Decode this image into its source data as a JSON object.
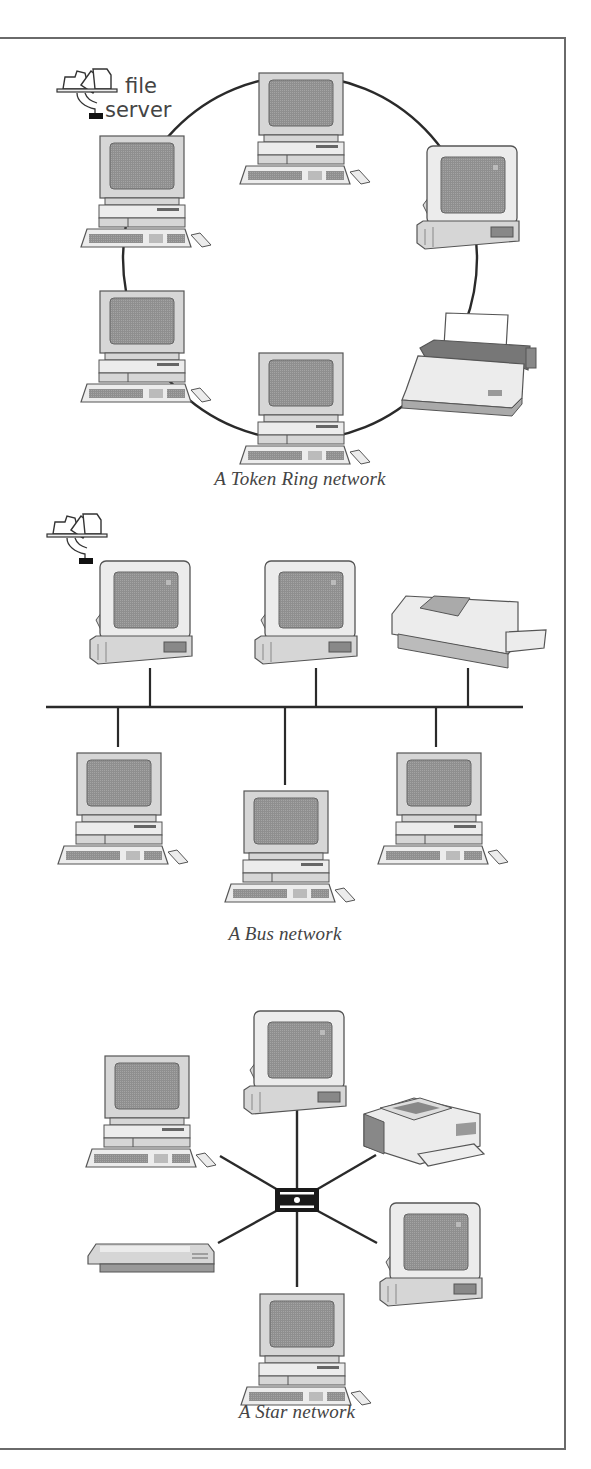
{
  "figure": {
    "colors": {
      "wire": "#2a2a2a",
      "frame": "#6a6a6a",
      "caption": "#444444",
      "screen": "#8f8f8f",
      "case": "#d6d6d6",
      "case_light": "#ececec",
      "outline": "#555555"
    },
    "token_ring": {
      "caption": "A Token Ring network",
      "caption_pos": [
        300,
        480
      ],
      "ring": {
        "cx": 300,
        "cy": 258,
        "rx": 177,
        "ry": 182
      },
      "file_server_label_line1": "file",
      "file_server_label_line2": "server",
      "devices": [
        {
          "type": "server-icon",
          "x": 55,
          "y": 65
        },
        {
          "type": "desktop",
          "x": 232,
          "y": 72
        },
        {
          "type": "desktop",
          "x": 73,
          "y": 135
        },
        {
          "type": "monitor-tower",
          "x": 415,
          "y": 145
        },
        {
          "type": "desktop",
          "x": 73,
          "y": 290
        },
        {
          "type": "dot-matrix-printer",
          "x": 400,
          "y": 312
        },
        {
          "type": "desktop",
          "x": 232,
          "y": 352
        }
      ]
    },
    "bus": {
      "caption": "A Bus network",
      "caption_pos": [
        285,
        935
      ],
      "backbone": {
        "x1": 46,
        "x2": 523,
        "y": 707
      },
      "taps": [
        {
          "x": 150,
          "y1": 668,
          "y2": 707
        },
        {
          "x": 316,
          "y1": 668,
          "y2": 707
        },
        {
          "x": 468,
          "y1": 668,
          "y2": 707
        },
        {
          "x": 118,
          "y1": 707,
          "y2": 747
        },
        {
          "x": 285,
          "y1": 707,
          "y2": 785
        },
        {
          "x": 436,
          "y1": 707,
          "y2": 747
        }
      ],
      "devices": [
        {
          "type": "server-icon",
          "x": 45,
          "y": 510
        },
        {
          "type": "monitor-tower",
          "x": 88,
          "y": 560
        },
        {
          "type": "monitor-tower",
          "x": 253,
          "y": 560
        },
        {
          "type": "laser-printer",
          "x": 388,
          "y": 588
        },
        {
          "type": "desktop",
          "x": 50,
          "y": 752
        },
        {
          "type": "desktop",
          "x": 217,
          "y": 790
        },
        {
          "type": "desktop",
          "x": 370,
          "y": 752
        }
      ]
    },
    "star": {
      "caption": "A Star network",
      "caption_pos": [
        297,
        1413
      ],
      "hub": {
        "x": 275,
        "y": 1188,
        "w": 44,
        "h": 24
      },
      "spokes": [
        {
          "x1": 297,
          "y1": 1188,
          "x2": 297,
          "y2": 1110
        },
        {
          "x1": 278,
          "y1": 1190,
          "x2": 220,
          "y2": 1156
        },
        {
          "x1": 316,
          "y1": 1190,
          "x2": 376,
          "y2": 1155
        },
        {
          "x1": 278,
          "y1": 1210,
          "x2": 218,
          "y2": 1243
        },
        {
          "x1": 316,
          "y1": 1210,
          "x2": 377,
          "y2": 1243
        },
        {
          "x1": 297,
          "y1": 1212,
          "x2": 297,
          "y2": 1287
        }
      ],
      "devices": [
        {
          "type": "monitor-tower",
          "x": 242,
          "y": 1010
        },
        {
          "type": "desktop",
          "x": 78,
          "y": 1055
        },
        {
          "type": "laser-printer-tray",
          "x": 362,
          "y": 1094
        },
        {
          "type": "scanner",
          "x": 84,
          "y": 1238
        },
        {
          "type": "monitor-tower",
          "x": 378,
          "y": 1202
        },
        {
          "type": "desktop",
          "x": 233,
          "y": 1293
        }
      ]
    }
  }
}
